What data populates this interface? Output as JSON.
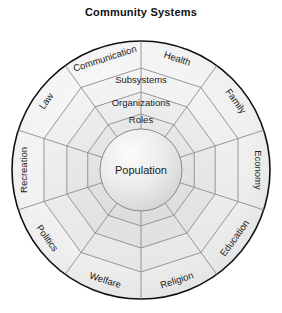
{
  "title": "Community Systems",
  "diagram": {
    "type": "concentric-wheel",
    "center_label": "Population",
    "rings": [
      {
        "name": "roles",
        "label": "Roles"
      },
      {
        "name": "organizations",
        "label": "Organizations"
      },
      {
        "name": "subsystems",
        "label": "Subsystems"
      }
    ],
    "sectors": [
      {
        "name": "health",
        "label": "Health"
      },
      {
        "name": "family",
        "label": "Family"
      },
      {
        "name": "economy",
        "label": "Economy"
      },
      {
        "name": "education",
        "label": "Education"
      },
      {
        "name": "religion",
        "label": "Religion"
      },
      {
        "name": "welfare",
        "label": "Welfare"
      },
      {
        "name": "politics",
        "label": "Politics"
      },
      {
        "name": "recreation",
        "label": "Recreation"
      },
      {
        "name": "law",
        "label": "Law"
      },
      {
        "name": "communication",
        "label": "Communication"
      }
    ],
    "colors": {
      "background": "#ffffff",
      "outline": "#111111",
      "grid_line": "#8c8c8c",
      "ring_fill_outer": "#f2f2f2",
      "ring_fill_mid": "#e8e8e8",
      "ring_fill_inner": "#e0e0e0",
      "core_fill": "#e4e4e4",
      "core_highlight": "#fbfbfb",
      "text": "#1a1a1a"
    }
  }
}
